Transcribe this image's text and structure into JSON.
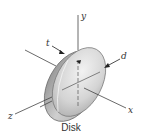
{
  "figure": {
    "caption": "Disk",
    "axes": {
      "x": "x",
      "y": "y",
      "z": "z"
    },
    "dimensions": {
      "thickness": "t",
      "diameter": "d"
    }
  }
}
